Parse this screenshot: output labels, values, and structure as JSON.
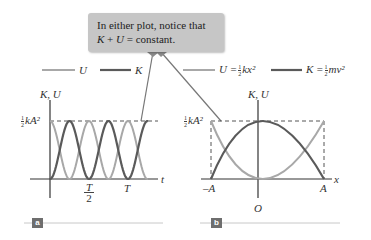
{
  "callout": {
    "line1": "In either plot, notice that",
    "line2_k": "K",
    "line2_plus": " + ",
    "line2_u": "U",
    "line2_rest": " = constant."
  },
  "legend": {
    "items": [
      {
        "label": "U",
        "color": "#a8a8a8"
      },
      {
        "label": "K",
        "color": "#5a5a5a"
      },
      {
        "label_lhs": "U =",
        "frac_num": "1",
        "frac_den": "2",
        "label_rhs": "kx²",
        "color": "#a8a8a8"
      },
      {
        "label_lhs": "K =",
        "frac_num": "1",
        "frac_den": "2",
        "label_rhs": "mv²",
        "color": "#5a5a5a"
      }
    ]
  },
  "plot_a": {
    "tag": "a",
    "y_axis_label": "K, U",
    "y_max_label_num": "1",
    "y_max_label_den": "2",
    "y_max_label_rest": "kA²",
    "x_axis_label": "t",
    "ticks": [
      {
        "label_num": "T",
        "label_den": "2"
      },
      {
        "label": "T"
      }
    ]
  },
  "plot_b": {
    "tag": "b",
    "y_axis_label": "K, U",
    "y_max_label_num": "1",
    "y_max_label_den": "2",
    "y_max_label_rest": "kA²",
    "x_axis_label": "x",
    "ticks": [
      "–A",
      "A"
    ],
    "origin_label": "O"
  },
  "colors": {
    "potential_U": "#a8a8a8",
    "kinetic_K": "#5a5a5a",
    "callout_bg": "#c6c6c6",
    "tag_bg": "#6e6e6e"
  },
  "chart_data": [
    {
      "type": "line",
      "title": "Energy vs time",
      "xlabel": "t",
      "ylabel": "K, U",
      "series": [
        {
          "name": "U",
          "expr": "(1/2)kA² cos²(ωt)"
        },
        {
          "name": "K",
          "expr": "(1/2)kA² sin²(ωt)"
        }
      ],
      "x_ticks": [
        "T/2",
        "T"
      ],
      "y_ticks": [
        "½kA²"
      ],
      "ylim": [
        0,
        "½kA²"
      ]
    },
    {
      "type": "line",
      "title": "Energy vs position",
      "xlabel": "x",
      "ylabel": "K, U",
      "series": [
        {
          "name": "U = ½kx²",
          "expr": "parabola, 0 at O, ½kA² at ±A"
        },
        {
          "name": "K = ½mv²",
          "expr": "inverted parabola, ½kA² at O, 0 at ±A"
        }
      ],
      "x_ticks": [
        "–A",
        "O",
        "A"
      ],
      "y_ticks": [
        "½kA²"
      ],
      "ylim": [
        0,
        "½kA²"
      ]
    }
  ]
}
